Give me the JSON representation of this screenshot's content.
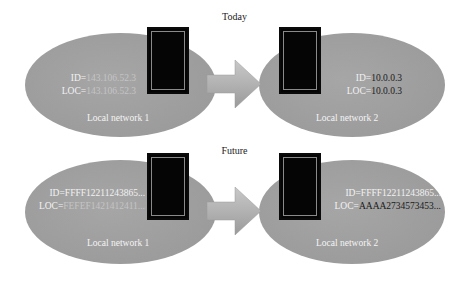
{
  "panels": {
    "today": {
      "title": "Today",
      "left": {
        "name": "Local network 1",
        "id_key": "ID=",
        "id_value": "143.106.52.3",
        "loc_key": "LOC=",
        "loc_value": "143.106.52.3"
      },
      "right": {
        "name": "Local network 2",
        "id_key": "ID=",
        "id_value": "10.0.0.3",
        "loc_key": "LOC=",
        "loc_value": "10.0.0.3"
      }
    },
    "future": {
      "title": "Future",
      "left": {
        "name": "Local network 1",
        "id_key": "ID=",
        "id_value": "FFFF12211243865...",
        "loc_key": "LOC=",
        "loc_value": "FEFEF1421412411..."
      },
      "right": {
        "name": "Local network 2",
        "id_key": "ID=",
        "id_value": "FFFF12211243865...",
        "loc_key": "LOC=",
        "loc_value": "AAAA2734573453..."
      }
    }
  },
  "colors": {
    "ellipse": "#9e9e9e",
    "device_box": "#050505",
    "arrow": "#b0b0b0",
    "label_light": "#f2f2f2",
    "label_dark": "#1a1a1a"
  },
  "icons": {
    "device": "device-box-icon",
    "arrow": "right-arrow-icon"
  }
}
